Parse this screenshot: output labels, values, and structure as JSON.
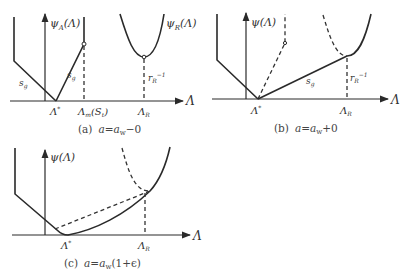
{
  "figure": {
    "panels": [
      {
        "id": "a",
        "caption": "(a)  a=a_w−0",
        "caption_label": "(a)",
        "caption_condition": "a=a",
        "caption_sub": "w",
        "caption_tail": "−0",
        "ylabel": "ψ",
        "ylabel_sub": "A",
        "ylabel_arg": "(Λ)",
        "curve_label": "ψ",
        "curve_label_sub": "R",
        "curve_label_arg": "(Λ)",
        "xlabel": "Λ",
        "ticks": [
          {
            "main": "Λ",
            "sup": "*"
          },
          {
            "main": "Λ",
            "sub": "m",
            "tail": "(S",
            "tail_sub": "t",
            "close": ")"
          },
          {
            "main": "Λ",
            "sub": "R"
          }
        ],
        "slope_label_left": "s",
        "slope_label_left_sub": "g",
        "slope_label_right": "s",
        "slope_label_right_sub": "g",
        "rR_label": "r",
        "rR_sub": "R",
        "rR_sup": "−1"
      },
      {
        "id": "b",
        "caption_label": "(b)",
        "caption_condition": "a=a",
        "caption_sub": "w",
        "caption_tail": "+0",
        "ylabel": "ψ(Λ)",
        "xlabel": "Λ",
        "ticks": [
          {
            "main": "Λ",
            "sup": "*"
          },
          {
            "main": "Λ",
            "sub": "R"
          }
        ],
        "slope_label": "s",
        "slope_label_sub": "g",
        "rR_label": "r",
        "rR_sub": "R",
        "rR_sup": "−1"
      },
      {
        "id": "c",
        "caption_label": "(c)",
        "caption_condition": "a=a",
        "caption_sub": "w",
        "caption_tail": "(1+ϵ)",
        "ylabel": "ψ(Λ)",
        "xlabel": "Λ",
        "ticks": [
          {
            "main": "Λ",
            "sup": "*"
          },
          {
            "main": "Λ",
            "sub": "R"
          }
        ]
      }
    ]
  }
}
